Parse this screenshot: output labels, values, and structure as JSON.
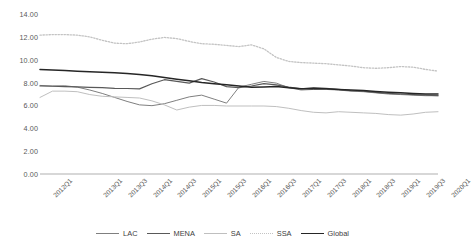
{
  "chart_data": {
    "type": "line",
    "title": "",
    "subtitle": "",
    "xlabel": "",
    "ylabel": "",
    "ylim": [
      0,
      14
    ],
    "ytick_step": 2,
    "yticks": [
      "0.00",
      "2.00",
      "4.00",
      "6.00",
      "8.00",
      "10.00",
      "12.00",
      "14.00"
    ],
    "grid": false,
    "legend_position": "bottom",
    "x": [
      "2012Q1",
      "2012Q2",
      "2012Q3",
      "2012Q4",
      "2013Q1",
      "2013Q2",
      "2013Q3",
      "2013Q4",
      "2014Q1",
      "2014Q2",
      "2014Q3",
      "2014Q4",
      "2015Q1",
      "2015Q2",
      "2015Q3",
      "2015Q4",
      "2016Q1",
      "2016Q2",
      "2016Q3",
      "2016Q4",
      "2017Q1",
      "2017Q2",
      "2017Q3",
      "2017Q4",
      "2018Q1",
      "2018Q2",
      "2018Q3",
      "2018Q4",
      "2019Q1",
      "2019Q2",
      "2019Q3",
      "2019Q4",
      "2020Q1"
    ],
    "xtick_labels": [
      "2012Q1",
      "2013Q1",
      "2013Q3",
      "2014Q1",
      "2014Q3",
      "2015Q1",
      "2015Q3",
      "2016Q1",
      "2016Q3",
      "2017Q1",
      "2017Q3",
      "2018Q1",
      "2018Q3",
      "2019Q1",
      "2019Q3",
      "2020Q1"
    ],
    "xtick_indices": [
      0,
      4,
      6,
      8,
      10,
      12,
      14,
      16,
      18,
      20,
      22,
      24,
      26,
      28,
      30,
      32
    ],
    "series": [
      {
        "name": "LAC",
        "color": "#7f7f7f",
        "style": "solid",
        "width": 1.0,
        "values": [
          7.75,
          7.7,
          7.72,
          7.6,
          7.35,
          7.05,
          6.7,
          6.35,
          6.05,
          5.98,
          6.15,
          6.45,
          6.75,
          6.9,
          6.55,
          6.2,
          7.6,
          7.85,
          8.1,
          7.95,
          7.55,
          7.35,
          7.4,
          7.4,
          7.35,
          7.25,
          7.2,
          7.1,
          7.0,
          6.95,
          6.9,
          6.85,
          6.85
        ]
      },
      {
        "name": "MENA",
        "color": "#595959",
        "style": "solid",
        "width": 1.2,
        "values": [
          7.7,
          7.68,
          7.65,
          7.62,
          7.58,
          7.55,
          7.5,
          7.48,
          7.45,
          7.9,
          8.25,
          8.1,
          7.95,
          8.35,
          8.05,
          7.65,
          7.55,
          7.7,
          7.9,
          7.8,
          7.6,
          7.45,
          7.55,
          7.5,
          7.4,
          7.3,
          7.25,
          7.15,
          7.05,
          7.0,
          6.95,
          6.9,
          6.85
        ]
      },
      {
        "name": "SA",
        "color": "#bfbfbf",
        "style": "solid",
        "width": 1.0,
        "values": [
          6.7,
          7.25,
          7.25,
          7.2,
          6.95,
          6.8,
          6.75,
          6.7,
          6.65,
          6.4,
          6.05,
          5.6,
          5.85,
          6.0,
          6.0,
          5.95,
          5.95,
          5.95,
          5.95,
          5.9,
          5.75,
          5.55,
          5.4,
          5.35,
          5.45,
          5.4,
          5.35,
          5.3,
          5.2,
          5.15,
          5.25,
          5.4,
          5.45
        ]
      },
      {
        "name": "SSA",
        "color": "#c3c3c3",
        "style": "dotted",
        "width": 1.3,
        "values": [
          12.15,
          12.2,
          12.2,
          12.15,
          12.0,
          11.7,
          11.45,
          11.4,
          11.55,
          11.8,
          11.95,
          11.85,
          11.6,
          11.4,
          11.35,
          11.25,
          11.15,
          11.3,
          10.95,
          10.2,
          9.85,
          9.75,
          9.7,
          9.65,
          9.55,
          9.45,
          9.3,
          9.25,
          9.3,
          9.4,
          9.35,
          9.15,
          9.0
        ]
      },
      {
        "name": "Global",
        "color": "#262626",
        "style": "solid",
        "width": 1.5,
        "values": [
          9.15,
          9.1,
          9.05,
          9.0,
          8.95,
          8.9,
          8.85,
          8.8,
          8.7,
          8.6,
          8.45,
          8.3,
          8.15,
          8.0,
          7.9,
          7.8,
          7.7,
          7.6,
          7.62,
          7.65,
          7.55,
          7.45,
          7.45,
          7.45,
          7.4,
          7.35,
          7.3,
          7.22,
          7.15,
          7.1,
          7.05,
          7.0,
          7.0
        ]
      }
    ]
  }
}
